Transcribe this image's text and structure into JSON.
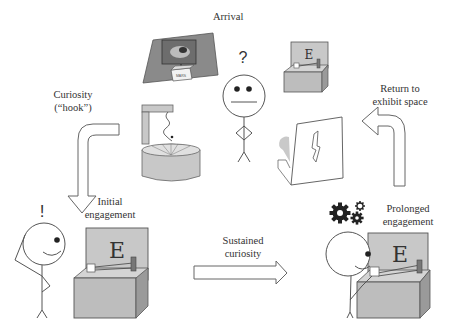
{
  "diagram": {
    "stages": {
      "arrival": {
        "label": "Arrival"
      },
      "curiosity_hook": {
        "line1": "Curiosity",
        "line2": "(“hook”)"
      },
      "initial_engagement": {
        "line1": "Initial",
        "line2": "engagement"
      },
      "sustained_curiosity": {
        "line1": "Sustained",
        "line2": "curiosity"
      },
      "prolonged_engagement": {
        "line1": "Prolonged",
        "line2": "engagement"
      },
      "return_to_exhibit": {
        "line1": "Return to",
        "line2": "exhibit space"
      }
    },
    "glyphs": {
      "question_mark": "?",
      "exclamation_mark": "!",
      "exhibit_letter": "E",
      "poster_box_label": "MARS"
    },
    "colors": {
      "exhibit_panel": "#c8c8c8",
      "exhibit_box_front": "#bdbdbd",
      "exhibit_box_side": "#9a9a9a",
      "poster_frame": "#8a8a8a",
      "outline": "#555555",
      "gear": "#222222"
    }
  }
}
